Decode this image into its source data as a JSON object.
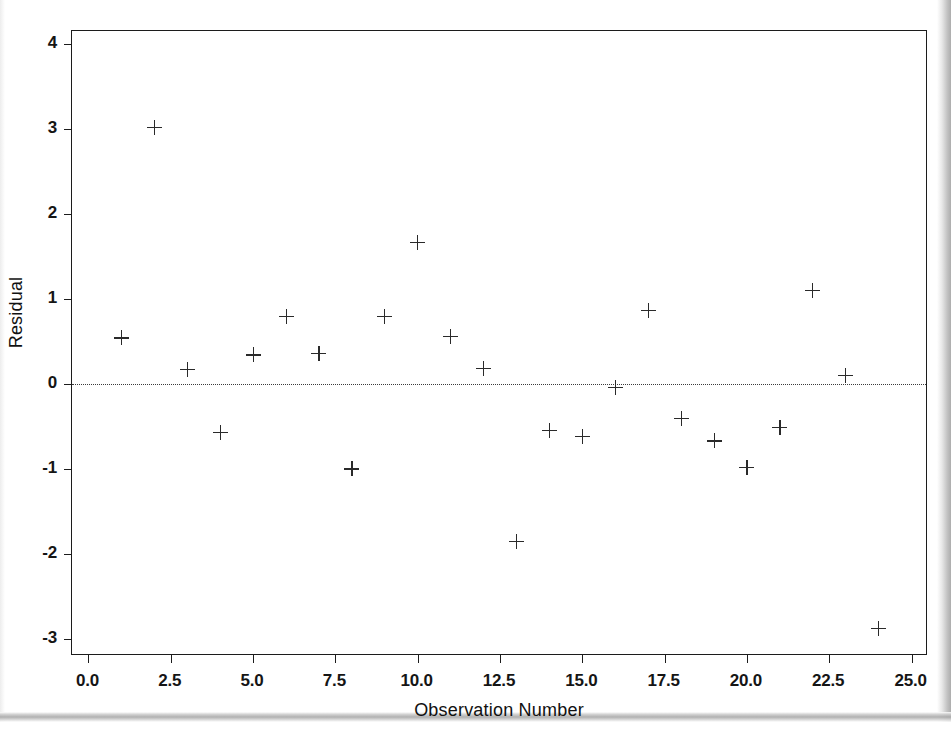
{
  "chart_data": {
    "type": "scatter",
    "title": "",
    "xlabel": "Observation Number",
    "ylabel": "Residual",
    "xlim": [
      -0.5,
      25.5
    ],
    "ylim": [
      -3.2,
      4.15
    ],
    "xticks": [
      0.0,
      2.5,
      5.0,
      7.5,
      10.0,
      12.5,
      15.0,
      17.5,
      20.0,
      22.5,
      25.0
    ],
    "xticklabels": [
      "0.0",
      "2.5",
      "5.0",
      "7.5",
      "10.0",
      "12.5",
      "15.0",
      "17.5",
      "20.0",
      "22.5",
      "25.0"
    ],
    "yticks": [
      -3,
      -2,
      -1,
      0,
      1,
      2,
      3,
      4
    ],
    "yticklabels": [
      "-3",
      "-2",
      "-1",
      "0",
      "1",
      "2",
      "3",
      "4"
    ],
    "grid": false,
    "legend": null,
    "marker": "plus",
    "marker_color": "#2a2a2a",
    "reference_line": {
      "y": 0,
      "style": "dotted",
      "color": "#3b3b3b"
    },
    "x": [
      1,
      2,
      3,
      4,
      5,
      6,
      7,
      8,
      9,
      10,
      11,
      12,
      13,
      14,
      15,
      16,
      17,
      18,
      19,
      20,
      21,
      22,
      23,
      24
    ],
    "y": [
      0.54,
      3.02,
      0.17,
      -0.57,
      0.34,
      0.79,
      0.36,
      -1.0,
      0.79,
      1.66,
      0.56,
      0.18,
      -1.85,
      -0.55,
      -0.62,
      -0.04,
      0.86,
      -0.41,
      -0.67,
      -0.98,
      -0.51,
      1.1,
      0.1,
      -2.88
    ],
    "points": [
      {
        "x": 1,
        "y": 0.54
      },
      {
        "x": 2,
        "y": 3.02
      },
      {
        "x": 3,
        "y": 0.17
      },
      {
        "x": 4,
        "y": -0.57
      },
      {
        "x": 5,
        "y": 0.34
      },
      {
        "x": 6,
        "y": 0.79
      },
      {
        "x": 7,
        "y": 0.36
      },
      {
        "x": 8,
        "y": -1.0
      },
      {
        "x": 9,
        "y": 0.79
      },
      {
        "x": 10,
        "y": 1.66
      },
      {
        "x": 11,
        "y": 0.56
      },
      {
        "x": 12,
        "y": 0.18
      },
      {
        "x": 13,
        "y": -1.85
      },
      {
        "x": 14,
        "y": -0.55
      },
      {
        "x": 15,
        "y": -0.62
      },
      {
        "x": 16,
        "y": -0.04
      },
      {
        "x": 17,
        "y": 0.86
      },
      {
        "x": 18,
        "y": -0.41
      },
      {
        "x": 19,
        "y": -0.67
      },
      {
        "x": 20,
        "y": -0.98
      },
      {
        "x": 21,
        "y": -0.51
      },
      {
        "x": 22,
        "y": 1.1
      },
      {
        "x": 23,
        "y": 0.1
      },
      {
        "x": 24,
        "y": -2.88
      }
    ]
  }
}
